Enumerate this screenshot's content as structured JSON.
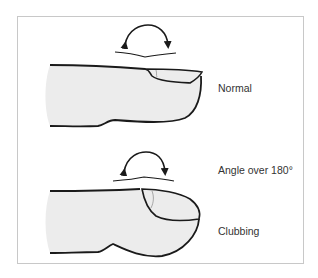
{
  "figure": {
    "panels": [
      {
        "id": "normal",
        "label": "Normal"
      },
      {
        "id": "clubbing",
        "label": "Clubbing",
        "annotation": "Angle over 180°"
      }
    ],
    "colors": {
      "finger_fill": "#ececec",
      "outline": "#1a1a1a",
      "frame": "#c8c8c8",
      "text": "#333333"
    }
  }
}
